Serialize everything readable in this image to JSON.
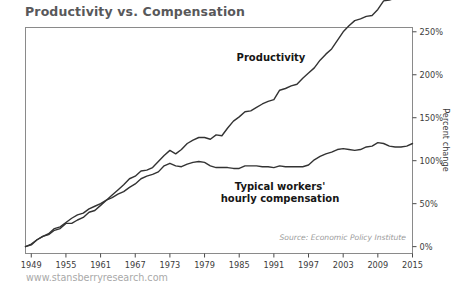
{
  "chart_title": "Productivity vs. Compensation",
  "watermark": "www.stansberryresearch.com",
  "source_note": "Source: Economic Policy Institute",
  "axis": {
    "ylabel": "Percent change",
    "ytick_labels": [
      "0%",
      "50%",
      "100%",
      "150%",
      "200%",
      "250%"
    ],
    "xtick_labels": [
      "1949",
      "1955",
      "1961",
      "1967",
      "1973",
      "1979",
      "1985",
      "1991",
      "1997",
      "2003",
      "2009",
      "2015"
    ]
  },
  "labels": {
    "productivity": "Productivity",
    "compensation_line1": "Typical workers'",
    "compensation_line2": "hourly compensation"
  },
  "colors": {
    "line": "#333333",
    "frame": "#8a8a8a",
    "title": "#58585a",
    "watermark": "#a9a9a9",
    "source": "#9b9b9b"
  },
  "chart_data": {
    "type": "line",
    "title": "Productivity vs. Compensation",
    "xlabel": "",
    "ylabel": "Percent change",
    "xlim": [
      1948,
      2015
    ],
    "ylim": [
      -8,
      255
    ],
    "grid": false,
    "legend": "inline-annotations",
    "yticks": [
      0,
      50,
      100,
      150,
      200,
      250
    ],
    "xticks": [
      1949,
      1955,
      1961,
      1967,
      1973,
      1979,
      1985,
      1991,
      1997,
      2003,
      2009,
      2015
    ],
    "annotations": [
      {
        "text": "Productivity",
        "x": 1992,
        "y": 205
      },
      {
        "text": "Typical workers' hourly compensation",
        "x": 1993,
        "y": 45
      },
      {
        "text": "Source: Economic Policy Institute",
        "x": 2005,
        "y": 6
      }
    ],
    "x": [
      1948,
      1949,
      1950,
      1951,
      1952,
      1953,
      1954,
      1955,
      1956,
      1957,
      1958,
      1959,
      1960,
      1961,
      1962,
      1963,
      1964,
      1965,
      1966,
      1967,
      1968,
      1969,
      1970,
      1971,
      1972,
      1973,
      1974,
      1975,
      1976,
      1977,
      1978,
      1979,
      1980,
      1981,
      1982,
      1983,
      1984,
      1985,
      1986,
      1987,
      1988,
      1989,
      1990,
      1991,
      1992,
      1993,
      1994,
      1995,
      1996,
      1997,
      1998,
      1999,
      2000,
      2001,
      2002,
      2003,
      2004,
      2005,
      2006,
      2007,
      2008,
      2009,
      2010,
      2011,
      2012,
      2013,
      2014,
      2015
    ],
    "series": [
      {
        "name": "Productivity",
        "values": [
          0,
          2,
          8,
          12,
          14,
          19,
          21,
          27,
          27,
          31,
          34,
          40,
          42,
          48,
          54,
          60,
          66,
          72,
          79,
          82,
          88,
          89,
          92,
          99,
          106,
          112,
          108,
          113,
          120,
          124,
          127,
          127,
          125,
          130,
          129,
          138,
          146,
          151,
          157,
          158,
          162,
          166,
          169,
          171,
          182,
          184,
          187,
          189,
          196,
          202,
          208,
          217,
          224,
          230,
          240,
          250,
          257,
          263,
          265,
          268,
          269,
          276,
          286,
          287,
          289,
          291,
          293,
          296
        ]
      },
      {
        "name": "Typical workers' hourly compensation",
        "values": [
          0,
          3,
          8,
          12,
          15,
          21,
          23,
          28,
          33,
          37,
          39,
          44,
          47,
          50,
          54,
          57,
          61,
          64,
          69,
          73,
          79,
          82,
          84,
          87,
          94,
          97,
          94,
          93,
          96,
          98,
          99,
          98,
          94,
          92,
          92,
          92,
          91,
          91,
          94,
          94,
          94,
          93,
          93,
          92,
          94,
          93,
          93,
          93,
          93,
          95,
          101,
          105,
          108,
          110,
          113,
          114,
          113,
          112,
          113,
          116,
          117,
          121,
          120,
          117,
          116,
          116,
          117,
          120
        ]
      }
    ]
  }
}
